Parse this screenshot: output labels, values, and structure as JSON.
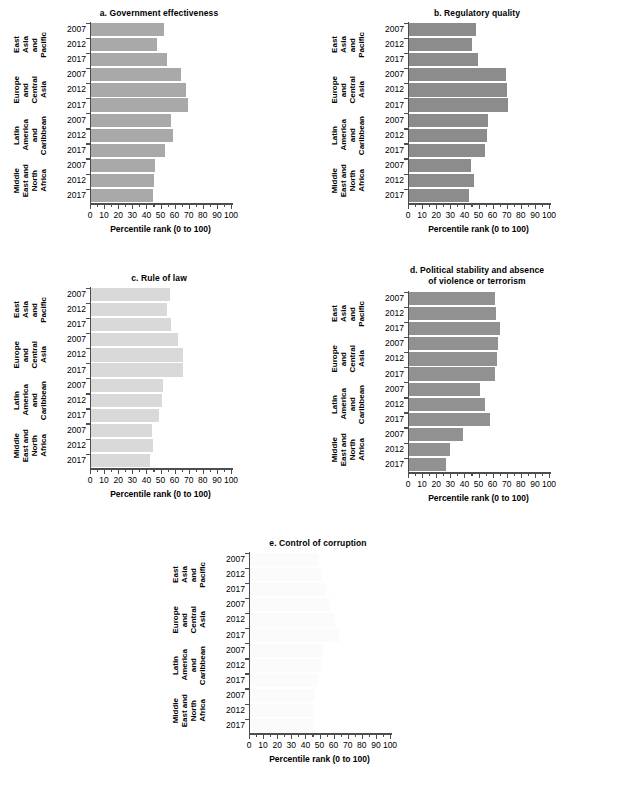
{
  "figure": {
    "axis_title": "Percentile rank (0 to 100)",
    "x_ticks": [
      "0",
      "10",
      "20",
      "30",
      "40",
      "50",
      "60",
      "70",
      "80",
      "90",
      "100"
    ],
    "regions": [
      {
        "name": "East Asia and Pacific",
        "words": [
          "East",
          "Asia",
          "and",
          "Pacific"
        ]
      },
      {
        "name": "Europe and Central Asia",
        "words": [
          "Europe",
          "and",
          "Central",
          "Asia"
        ]
      },
      {
        "name": "Latin America and Caribbean",
        "words": [
          "Latin",
          "America",
          "and",
          "Caribbean"
        ]
      },
      {
        "name": "Middle East and North Africa",
        "words": [
          "Middle",
          "East and",
          "North",
          "Africa"
        ]
      }
    ],
    "years": [
      "2007",
      "2012",
      "2017"
    ]
  },
  "chart_data": [
    {
      "id": "a",
      "type": "bar",
      "title": "a. Government effectiveness",
      "xlabel": "Percentile rank (0 to 100)",
      "ylabel": "",
      "xlim": [
        0,
        100
      ],
      "grid": false,
      "legend": "none",
      "orientation": "horizontal",
      "bar_color": "#a9a9a9",
      "categories": [
        "East Asia and Pacific 2007",
        "East Asia and Pacific 2012",
        "East Asia and Pacific 2017",
        "Europe and Central Asia 2007",
        "Europe and Central Asia 2012",
        "Europe and Central Asia 2017",
        "Latin America and Caribbean 2007",
        "Latin America and Caribbean 2012",
        "Latin America and Caribbean 2017",
        "Middle East and North Africa 2007",
        "Middle East and North Africa 2012",
        "Middle East and North Africa 2017"
      ],
      "values": [
        52,
        47,
        54,
        64,
        67.5,
        69,
        57,
        58,
        52.5,
        45.5,
        45,
        44
      ]
    },
    {
      "id": "b",
      "type": "bar",
      "title": "b. Regulatory quality",
      "xlabel": "Percentile rank (0 to 100)",
      "ylabel": "",
      "xlim": [
        0,
        100
      ],
      "grid": false,
      "legend": "none",
      "orientation": "horizontal",
      "bar_color": "#8c8c8c",
      "categories": [
        "East Asia and Pacific 2007",
        "East Asia and Pacific 2012",
        "East Asia and Pacific 2017",
        "Europe and Central Asia 2007",
        "Europe and Central Asia 2012",
        "Europe and Central Asia 2017",
        "Latin America and Caribbean 2007",
        "Latin America and Caribbean 2012",
        "Latin America and Caribbean 2017",
        "Middle East and North Africa 2007",
        "Middle East and North Africa 2012",
        "Middle East and North Africa 2017"
      ],
      "values": [
        47.5,
        45,
        49,
        68.5,
        69.5,
        70.5,
        56,
        55,
        54,
        44,
        46,
        42.5
      ]
    },
    {
      "id": "c",
      "type": "bar",
      "title": "c. Rule of law",
      "xlabel": "Percentile rank (0 to 100)",
      "ylabel": "",
      "xlim": [
        0,
        100
      ],
      "grid": false,
      "legend": "none",
      "orientation": "horizontal",
      "bar_color": "#d9d9d9",
      "categories": [
        "East Asia and Pacific 2007",
        "East Asia and Pacific 2012",
        "East Asia and Pacific 2017",
        "Europe and Central Asia 2007",
        "Europe and Central Asia 2012",
        "Europe and Central Asia 2017",
        "Latin America and Caribbean 2007",
        "Latin America and Caribbean 2012",
        "Latin America and Caribbean 2017",
        "Middle East and North Africa 2007",
        "Middle East and North Africa 2012",
        "Middle East and North Africa 2017"
      ],
      "values": [
        56,
        54,
        56.5,
        62,
        65,
        65,
        51,
        50.5,
        48.5,
        43,
        44,
        42
      ]
    },
    {
      "id": "d",
      "type": "bar",
      "title": "d. Political stability and absence of violence or terrorism",
      "title_line1": "d. Political stability and absence",
      "title_line2": "of violence or terrorism",
      "xlabel": "Percentile rank (0 to 100)",
      "ylabel": "",
      "xlim": [
        0,
        100
      ],
      "grid": false,
      "legend": "none",
      "orientation": "horizontal",
      "bar_color": "#919191",
      "categories": [
        "East Asia and Pacific 2007",
        "East Asia and Pacific 2012",
        "East Asia and Pacific 2017",
        "Europe and Central Asia 2007",
        "Europe and Central Asia 2012",
        "Europe and Central Asia 2017",
        "Latin America and Caribbean 2007",
        "Latin America and Caribbean 2012",
        "Latin America and Caribbean 2017",
        "Middle East and North Africa 2007",
        "Middle East and North Africa 2012",
        "Middle East and North Africa 2017"
      ],
      "values": [
        61,
        62,
        64.5,
        63,
        62.5,
        61,
        50.5,
        54,
        57.5,
        38,
        29,
        26
      ]
    },
    {
      "id": "e",
      "type": "bar",
      "title": "e. Control of corruption",
      "xlabel": "Percentile rank (0 to 100)",
      "ylabel": "",
      "xlim": [
        0,
        100
      ],
      "grid": false,
      "legend": "none",
      "orientation": "horizontal",
      "bar_color": "#fbfbfb",
      "categories": [
        "East Asia and Pacific 2007",
        "East Asia and Pacific 2012",
        "East Asia and Pacific 2017",
        "Europe and Central Asia 2007",
        "Europe and Central Asia 2012",
        "Europe and Central Asia 2017",
        "Latin America and Caribbean 2007",
        "Latin America and Caribbean 2012",
        "Latin America and Caribbean 2017",
        "Middle East and North Africa 2007",
        "Middle East and North Africa 2012",
        "Middle East and North Africa 2017"
      ],
      "values": [
        49,
        51,
        54,
        57,
        60,
        63,
        52,
        50,
        48,
        46,
        45,
        45
      ]
    }
  ]
}
